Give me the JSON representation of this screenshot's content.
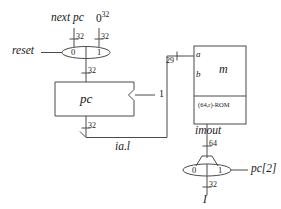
{
  "diagram": {
    "stroke_color": "#4a4a4a",
    "text_color": "#1a1a1a",
    "background": "#ffffff"
  },
  "signals": {
    "next_pc": "next pc",
    "zero_const_base": "0",
    "zero_const_sup": "32",
    "reset": "reset",
    "pc_reg": "pc",
    "clock_one": "1",
    "ia_l": "ia.l",
    "imout": "imout",
    "pc_sel": "pc[2]",
    "instr_out": "I",
    "rom_name": "m",
    "rom_port_a": "a",
    "rom_port_b": "b",
    "rom_kind": "(64,r)-ROM"
  },
  "bitwidths": {
    "next_pc_w": "32",
    "zero_w": "32",
    "mux_top_out_w": "32",
    "pc_out_w": "32",
    "rom_addr_w": "29",
    "imout_w": "64",
    "instr_w": "32"
  },
  "mux_top": {
    "input_0_label": "0",
    "input_1_label": "1",
    "select_signal": "reset"
  },
  "mux_bottom": {
    "input_0_label": "0",
    "input_1_label": "1",
    "select_signal": "pc[2]"
  }
}
